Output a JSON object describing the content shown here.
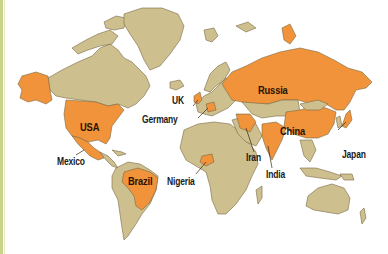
{
  "map": {
    "type": "world-map",
    "colors": {
      "land": "#cdbf8e",
      "highlight": "#f0933a",
      "border": "#7a6a45",
      "water": "#ffffff",
      "frame_accent": "#c7d48c"
    },
    "highlighted_countries": [
      {
        "name": "USA",
        "label": "USA",
        "label_inside": true
      },
      {
        "name": "Mexico",
        "label": "Mexico",
        "label_inside": false
      },
      {
        "name": "Brazil",
        "label": "Brazil",
        "label_inside": true
      },
      {
        "name": "UK",
        "label": "UK",
        "label_inside": false
      },
      {
        "name": "Germany",
        "label": "Germany",
        "label_inside": false
      },
      {
        "name": "Nigeria",
        "label": "Nigeria",
        "label_inside": false
      },
      {
        "name": "Russia",
        "label": "Russia",
        "label_inside": true
      },
      {
        "name": "Iran",
        "label": "Iran",
        "label_inside": false
      },
      {
        "name": "India",
        "label": "India",
        "label_inside": false
      },
      {
        "name": "China",
        "label": "China",
        "label_inside": true
      },
      {
        "name": "Japan",
        "label": "Japan",
        "label_inside": false
      }
    ]
  }
}
